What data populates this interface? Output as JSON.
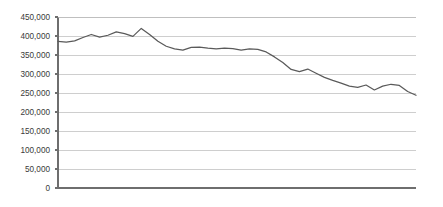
{
  "chart_data": {
    "type": "line",
    "title": "",
    "subtitle": "",
    "xlabel": "",
    "ylabel": "",
    "ylim": [
      0,
      450000
    ],
    "xlim": [
      0,
      43
    ],
    "grid": true,
    "grid_axis": "y",
    "legend": false,
    "legend_position": "none",
    "y_ticks": [
      0,
      50000,
      100000,
      150000,
      200000,
      250000,
      300000,
      350000,
      400000,
      450000
    ],
    "y_tick_labels": [
      "0",
      "50,000",
      "100,000",
      "150,000",
      "200,000",
      "250,000",
      "300,000",
      "350,000",
      "400,000",
      "450,000"
    ],
    "x_ticks": [],
    "x_tick_labels": [],
    "series": [
      {
        "name": "series-1",
        "color": "#5a5a5a",
        "x": [
          0,
          1,
          2,
          3,
          4,
          5,
          6,
          7,
          8,
          9,
          10,
          11,
          12,
          13,
          14,
          15,
          16,
          17,
          18,
          19,
          20,
          21,
          22,
          23,
          24,
          25,
          26,
          27,
          28,
          29,
          30,
          31,
          32,
          33,
          34,
          35,
          36,
          37,
          38,
          39,
          40,
          41,
          42,
          43
        ],
        "values": [
          386000,
          384000,
          387000,
          396000,
          404000,
          397000,
          402000,
          411000,
          406000,
          399000,
          420000,
          404000,
          386000,
          373000,
          366000,
          363000,
          370000,
          371000,
          368000,
          366000,
          368000,
          367000,
          363000,
          366000,
          365000,
          358000,
          345000,
          330000,
          312000,
          306000,
          313000,
          302000,
          291000,
          283000,
          276000,
          268000,
          265000,
          271000,
          258000,
          268000,
          273000,
          270000,
          254000,
          244000
        ],
        "marker": "none",
        "linewidth": 1.25
      }
    ],
    "annotations": [],
    "plot_area": {
      "left_px": 58,
      "right_px": 416,
      "top_px": 17,
      "bottom_px": 188
    },
    "axis_colors": {
      "grid": "#b9b9b9",
      "axis": "#6e6e6e",
      "tick_text": "#3a3a3a"
    }
  }
}
